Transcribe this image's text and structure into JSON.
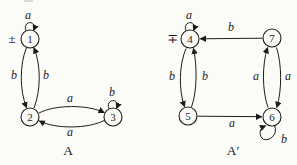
{
  "figure": {
    "background": "#fbfbf8",
    "ink": "#1c1c1c",
    "automaton_a": {
      "caption": "A",
      "start_accept_marker": "±",
      "states": {
        "s1": "1",
        "s2": "2",
        "s3": "3"
      },
      "labels": {
        "loop_1": "a",
        "edge_1_2": "b",
        "edge_2_1": "b",
        "edge_2_3": "a",
        "edge_3_2": "a",
        "loop_3": "b"
      }
    },
    "automaton_a_prime": {
      "caption": "A′",
      "start_accept_marker": "∓",
      "states": {
        "s4": "4",
        "s5": "5",
        "s6": "6",
        "s7": "7"
      },
      "labels": {
        "loop_4": "a",
        "edge_7_4": "b",
        "edge_4_5": "b",
        "edge_5_4": "b",
        "edge_5_6": "a",
        "edge_6_7": "a",
        "edge_7_6": "a",
        "loop_6": "b"
      }
    }
  }
}
